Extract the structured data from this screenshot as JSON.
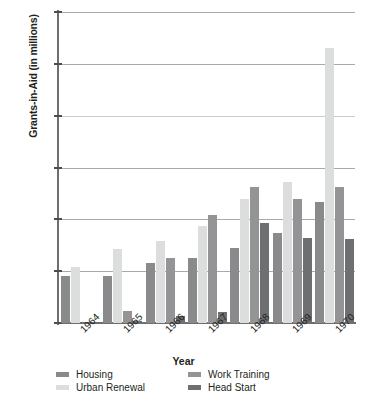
{
  "chart_data": {
    "type": "bar",
    "title": "",
    "xlabel": "Year",
    "ylabel": "Grants-in-Aid (in millions)",
    "ylim": [
      0,
      1200
    ],
    "ytick_values": [
      0,
      200,
      400,
      600,
      800,
      1000,
      1200
    ],
    "ytick_labels": [
      "0",
      "200",
      "400",
      "600",
      "800",
      "1000",
      "1200"
    ],
    "grid": true,
    "legend_position": "bottom",
    "categories": [
      "1964",
      "1965",
      "1966",
      "1967",
      "1968",
      "1969",
      "1970"
    ],
    "series": [
      {
        "name": "Housing",
        "color": "#8a8a8c",
        "values": [
          180,
          180,
          230,
          250,
          290,
          348,
          467
        ]
      },
      {
        "name": "Urban Renewal",
        "color": "#dcdddd",
        "values": [
          215,
          285,
          318,
          375,
          478,
          543,
          1060
        ]
      },
      {
        "name": "Work Training",
        "color": "#949496",
        "values": [
          0,
          48,
          252,
          415,
          523,
          477,
          523
        ]
      },
      {
        "name": "Head Start",
        "color": "#6e6f71",
        "values": [
          0,
          8,
          27,
          42,
          385,
          327,
          325
        ]
      }
    ]
  },
  "axes": {
    "y_title": "Grants-in-Aid (in millions)",
    "x_title": "Year"
  },
  "legend": {
    "items": [
      {
        "label": "Housing",
        "color": "#8a8a8c"
      },
      {
        "label": "Urban Renewal",
        "color": "#dcdddd"
      },
      {
        "label": "Work Training",
        "color": "#949496"
      },
      {
        "label": "Head Start",
        "color": "#6e6f71"
      }
    ]
  },
  "style": {
    "axis_color": "#6d6e71",
    "grid_color": "#a7a9ac",
    "text_color": "#231f20",
    "background": "#ffffff"
  }
}
